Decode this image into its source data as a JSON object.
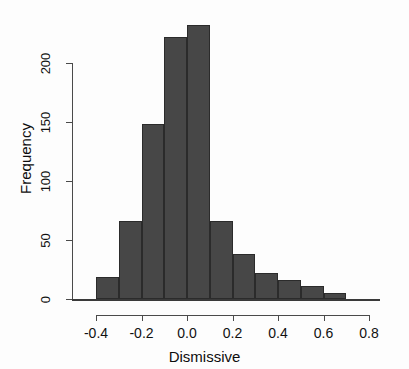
{
  "chart_data": {
    "type": "bar",
    "title": "",
    "subtitle": "",
    "xlabel": "Dismissive",
    "ylabel": "Frequency",
    "grid": false,
    "legend": null,
    "bin_width": 0.1,
    "bin_edges": [
      -0.4,
      -0.3,
      -0.2,
      -0.1,
      0.0,
      0.1,
      0.2,
      0.3,
      0.4,
      0.5,
      0.6,
      0.7
    ],
    "categories": [
      "-0.4",
      "-0.3",
      "-0.2",
      "-0.1",
      "0.0",
      "0.1",
      "0.2",
      "0.3",
      "0.4",
      "0.5",
      "0.6"
    ],
    "values": [
      19,
      66,
      148,
      222,
      232,
      66,
      38,
      22,
      16,
      11,
      5
    ],
    "bars": [
      {
        "bin_start": -0.4,
        "bin_end": -0.3,
        "value": 19
      },
      {
        "bin_start": -0.3,
        "bin_end": -0.2,
        "value": 66
      },
      {
        "bin_start": -0.2,
        "bin_end": -0.1,
        "value": 148
      },
      {
        "bin_start": -0.1,
        "bin_end": 0.0,
        "value": 222
      },
      {
        "bin_start": 0.0,
        "bin_end": 0.1,
        "value": 232
      },
      {
        "bin_start": 0.1,
        "bin_end": 0.2,
        "value": 66
      },
      {
        "bin_start": 0.2,
        "bin_end": 0.3,
        "value": 38
      },
      {
        "bin_start": 0.3,
        "bin_end": 0.4,
        "value": 22
      },
      {
        "bin_start": 0.4,
        "bin_end": 0.5,
        "value": 16
      },
      {
        "bin_start": 0.5,
        "bin_end": 0.6,
        "value": 11
      },
      {
        "bin_start": 0.6,
        "bin_end": 0.7,
        "value": 5
      }
    ],
    "xlim": [
      -0.45,
      0.85
    ],
    "ylim": [
      0,
      240
    ],
    "xticks": [
      -0.4,
      -0.2,
      0.0,
      0.2,
      0.4,
      0.6,
      0.8
    ],
    "xtick_labels": [
      "-0.4",
      "-0.2",
      "0.0",
      "0.2",
      "0.4",
      "0.6",
      "0.8"
    ],
    "yticks": [
      0,
      50,
      100,
      150,
      200
    ],
    "ytick_labels": [
      "0",
      "50",
      "100",
      "150",
      "200"
    ],
    "bar_color": "#474747",
    "bar_border_color": "#2b2b2b",
    "axis_color": "#4a4a4a",
    "background": "#ffffff"
  }
}
